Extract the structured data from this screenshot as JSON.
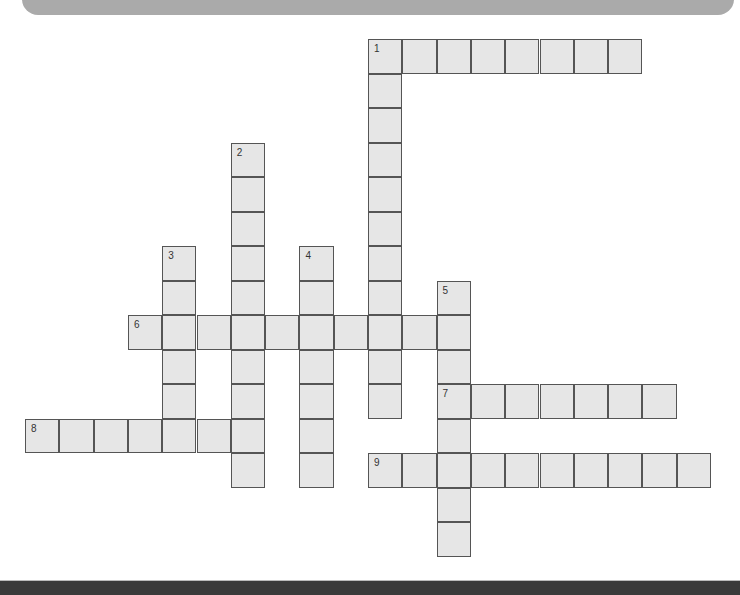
{
  "header": {
    "banner_color": "#aaaaaa"
  },
  "footer": {
    "bar_color": "#3a3a3a"
  },
  "grid": {
    "origin_x": 25,
    "origin_y": 39,
    "cell_w": 34.3,
    "cell_h": 34.5,
    "cell_fill": "#e6e6e6",
    "cell_border": "#555555"
  },
  "clues": [
    {
      "number": "1",
      "direction": "across",
      "row": 0,
      "col": 10,
      "length": 8
    },
    {
      "number": "1",
      "direction": "down",
      "row": 0,
      "col": 10,
      "length": 11
    },
    {
      "number": "2",
      "direction": "down",
      "row": 3,
      "col": 6,
      "length": 10
    },
    {
      "number": "3",
      "direction": "down",
      "row": 6,
      "col": 4,
      "length": 5
    },
    {
      "number": "4",
      "direction": "down",
      "row": 6,
      "col": 8,
      "length": 7
    },
    {
      "number": "5",
      "direction": "down",
      "row": 7,
      "col": 12,
      "length": 8
    },
    {
      "number": "6",
      "direction": "across",
      "row": 8,
      "col": 3,
      "length": 10
    },
    {
      "number": "7",
      "direction": "across",
      "row": 10,
      "col": 12,
      "length": 7
    },
    {
      "number": "8",
      "direction": "across",
      "row": 11,
      "col": 0,
      "length": 7
    },
    {
      "number": "9",
      "direction": "across",
      "row": 12,
      "col": 10,
      "length": 10
    }
  ]
}
